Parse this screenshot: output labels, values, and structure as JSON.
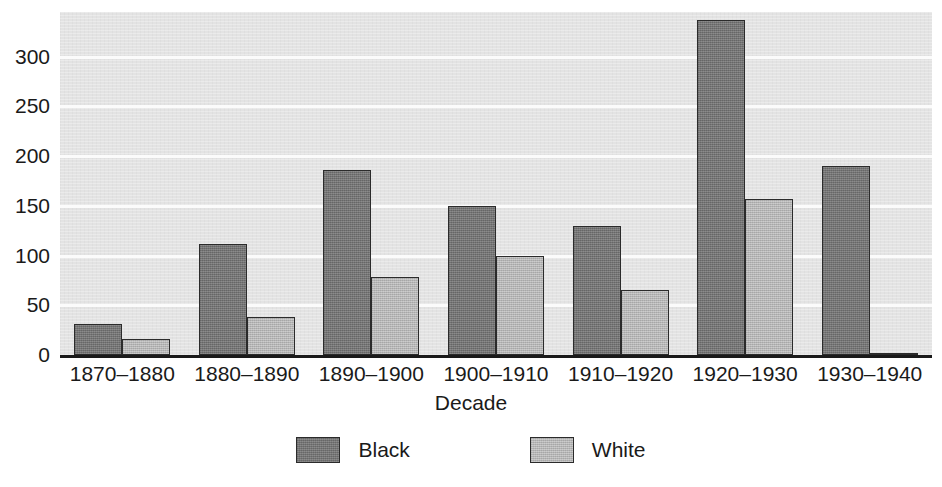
{
  "chart_data": {
    "type": "bar",
    "title": "",
    "xlabel": "Decade",
    "ylabel": "",
    "categories": [
      "1870–1880",
      "1880–1890",
      "1890–1900",
      "1900–1910",
      "1910–1920",
      "1920–1930",
      "1930–1940"
    ],
    "series": [
      {
        "name": "Black",
        "color": "#777777",
        "values": [
          31,
          112,
          186,
          150,
          130,
          337,
          190
        ]
      },
      {
        "name": "White",
        "color": "#b9b9b9",
        "values": [
          16,
          38,
          78,
          100,
          65,
          157,
          1
        ]
      }
    ],
    "ylim": [
      0,
      345
    ],
    "yticks": [
      0,
      50,
      100,
      150,
      200,
      250,
      300
    ],
    "ytick_labels": [
      "0",
      "50",
      "100",
      "150",
      "200",
      "250",
      "300"
    ],
    "grid": true,
    "grid_color": "#fbfbfb",
    "plot_background": "#e3e3e3",
    "legend_position": "bottom",
    "legend": [
      {
        "label": "Black",
        "color": "#777777"
      },
      {
        "label": "White",
        "color": "#b9b9b9"
      }
    ]
  }
}
